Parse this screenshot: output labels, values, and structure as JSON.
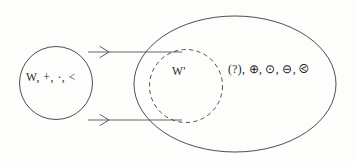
{
  "figure": {
    "background_color": "#fdfdfc",
    "stroke_color": "#3a3a3a",
    "source_set": {
      "label": "W, +, ·, <",
      "shape": "circle",
      "line_style": "solid"
    },
    "target_subset": {
      "label": "W'",
      "shape": "circle",
      "line_style": "dashed"
    },
    "outer_set": {
      "shape": "ellipse",
      "line_style": "solid"
    },
    "operations": {
      "label": "(?), ⊕, ⊙, ⊖, ⧀"
    },
    "arrows": [
      {
        "name": "upper-arrow"
      },
      {
        "name": "lower-arrow"
      }
    ]
  }
}
